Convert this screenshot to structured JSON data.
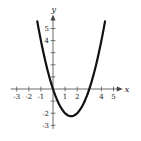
{
  "chart_data": {
    "type": "line",
    "title": "",
    "xlabel": "x",
    "ylabel": "y",
    "function": "y = x^2 - 3x",
    "xlim": [
      -3.5,
      5.6
    ],
    "ylim": [
      -3.3,
      6
    ],
    "grid": false,
    "legend": null,
    "x_ticks": [
      -3,
      -2,
      -1,
      1,
      2,
      3,
      4,
      5
    ],
    "x_tick_labels": [
      {
        "value": -3,
        "label": "-3"
      },
      {
        "value": -2,
        "label": "-2"
      },
      {
        "value": -1,
        "label": "-1"
      },
      {
        "value": 1,
        "label": "1"
      },
      {
        "value": 2,
        "label": "2"
      },
      {
        "value": 4,
        "label": "4"
      },
      {
        "value": 5,
        "label": "5"
      }
    ],
    "y_ticks": [
      -3,
      -2,
      -1,
      1,
      2,
      3,
      4,
      5
    ],
    "y_tick_labels": [
      {
        "value": 5,
        "label": "5"
      },
      {
        "value": 4,
        "label": "4"
      },
      {
        "value": -2,
        "label": "-2"
      },
      {
        "value": -3,
        "label": "-3"
      }
    ],
    "series": [
      {
        "name": "parabola",
        "x": [
          -1.3,
          -1,
          -0.5,
          0,
          0.5,
          1,
          1.5,
          2,
          2.5,
          3,
          3.5,
          4,
          4.3
        ],
        "y": [
          5.59,
          4,
          1.75,
          0,
          -1.25,
          -2,
          -2.25,
          -2,
          -1.25,
          0,
          1.75,
          4,
          5.59
        ]
      }
    ],
    "key_points": {
      "vertex": [
        1.5,
        -2.25
      ],
      "x_intercepts": [
        0,
        3
      ]
    }
  },
  "labels": {
    "x_axis": "x",
    "y_axis": "y"
  },
  "colors": {
    "curve": "#111111",
    "axes": "#444444",
    "background": "#ffffff"
  }
}
